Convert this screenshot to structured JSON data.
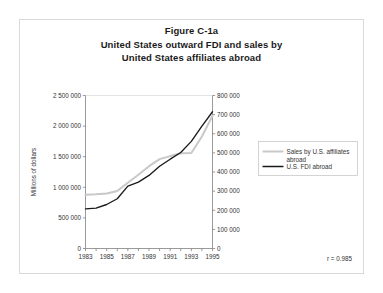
{
  "figure": {
    "title_lines": [
      "Figure C-1a",
      "United States outward FDI and sales by",
      "United States affiliates abroad"
    ],
    "correlation_note": "r = 0.985"
  },
  "chart_data": {
    "type": "line",
    "title": "Figure C-1a United States outward FDI and sales by United States affiliates abroad",
    "xlabel": "",
    "ylabel": "Millions of dollars",
    "y2label": "",
    "grid": false,
    "legend_position": "right",
    "xlim": [
      1983,
      1995
    ],
    "ylim": [
      0,
      2500000
    ],
    "y2lim": [
      0,
      800000
    ],
    "x": [
      1983,
      1984,
      1985,
      1986,
      1987,
      1988,
      1989,
      1990,
      1991,
      1992,
      1993,
      1994,
      1995
    ],
    "xticks": [
      1983,
      1984,
      1985,
      1986,
      1987,
      1988,
      1989,
      1990,
      1991,
      1992,
      1993,
      1994,
      1995
    ],
    "xtick_labels": [
      "1983",
      "",
      "1985",
      "",
      "1987",
      "",
      "1989",
      "",
      "1991",
      "",
      "1993",
      "",
      "1995"
    ],
    "yticks": [
      0,
      500000,
      1000000,
      1500000,
      2000000,
      2500000
    ],
    "ytick_labels": [
      "0",
      "500 000",
      "1 000 000",
      "1 500 000",
      "2 000 000",
      "2 500 000"
    ],
    "y2ticks": [
      0,
      100000,
      200000,
      300000,
      400000,
      500000,
      600000,
      700000,
      800000
    ],
    "y2tick_labels": [
      "0",
      "100 000",
      "200 000",
      "300 000",
      "400 000",
      "500 000",
      "600 000",
      "700 000",
      "800 000"
    ],
    "series": [
      {
        "name": "Sales by U.S. affiliates abroad",
        "axis": "left",
        "color": "#c8c8c8",
        "values": [
          880000,
          885000,
          900000,
          940000,
          1075000,
          1205000,
          1345000,
          1460000,
          1510000,
          1555000,
          1560000,
          1830000,
          2170000
        ]
      },
      {
        "name": "U.S. FDI abroad",
        "axis": "right",
        "color": "#1a1a1a",
        "values": [
          207000,
          211000,
          230000,
          260000,
          326000,
          347000,
          382000,
          430000,
          467000,
          502000,
          560000,
          640000,
          715000
        ]
      }
    ],
    "annotations": [
      {
        "text": "r = 0.985",
        "position": "bottom-right"
      }
    ]
  },
  "legend": {
    "items": [
      {
        "label_line1": "Sales by U.S. affiliates",
        "label_line2": "abroad",
        "color": "#c8c8c8"
      },
      {
        "label_line1": "U.S. FDI abroad",
        "label_line2": "",
        "color": "#1a1a1a"
      }
    ]
  }
}
